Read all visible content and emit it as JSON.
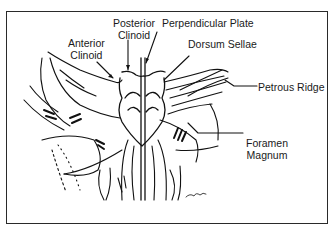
{
  "diagram": {
    "labels": {
      "anterior_clinoid": [
        "Anterior",
        "Clinoid"
      ],
      "posterior_clinoid": [
        "Posterior",
        "Clinoid"
      ],
      "perpendicular_plate": "Perpendicular Plate",
      "dorsum_sellae": "Dorsum Sellae",
      "petrous_ridge": "Petrous Ridge",
      "foramen_magnum": [
        "Foramen",
        "Magnum"
      ]
    },
    "signature": "artist-signature",
    "colors": {
      "line": "#111111",
      "frame": "#2a2a2a",
      "background": "#ffffff"
    }
  }
}
